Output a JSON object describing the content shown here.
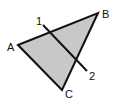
{
  "diagram": {
    "title": "",
    "colors": {
      "fill": "#c8c8c8",
      "stroke": "#111111",
      "background": "#ffffff"
    },
    "triangle": {
      "vertices": [
        {
          "label": "A",
          "x": 18,
          "y": 45,
          "label_x": 7,
          "label_y": 51
        },
        {
          "label": "B",
          "x": 98,
          "y": 13,
          "label_x": 102,
          "label_y": 18
        },
        {
          "label": "C",
          "x": 62,
          "y": 90,
          "label_x": 65,
          "label_y": 98
        }
      ]
    },
    "line": {
      "start": {
        "label": "1",
        "x": 43,
        "y": 25,
        "label_x": 36,
        "label_y": 25
      },
      "end": {
        "label": "2",
        "x": 87,
        "y": 71,
        "label_x": 89,
        "label_y": 80
      }
    }
  }
}
